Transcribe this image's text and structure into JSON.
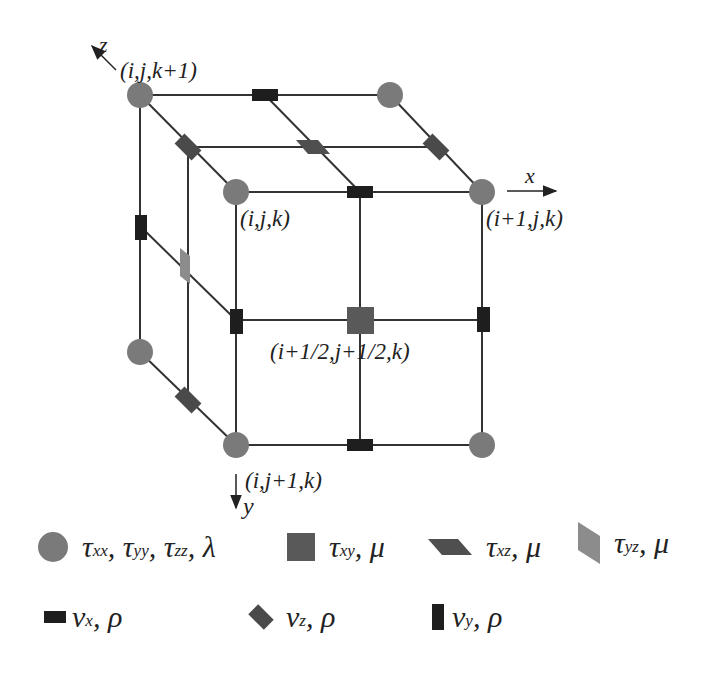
{
  "figure": {
    "type": "staggered-grid-cell",
    "axes": {
      "x": "x",
      "y": "y",
      "z": "z"
    },
    "node_labels": {
      "back_top_left": "(i,j,k+1)",
      "front_top_left": "(i,j,k)",
      "front_top_right": "(i+1,j,k)",
      "center": "(i+1/2,j+1/2,k)",
      "front_bottom_left": "(i,j+1,k)"
    },
    "colors": {
      "normal_stress": "#7a7a7a",
      "shear_xy": "#595959",
      "shear_xz": "#4f4f4f",
      "shear_yz": "#8c8c8c",
      "velocity_x": "#1e1e1e",
      "velocity_y": "#1e1e1e",
      "velocity_z": "#4a4a4a",
      "grid_line": "#333333"
    }
  },
  "legend": {
    "row1": [
      {
        "symbol": "circle",
        "name": "normal-stress",
        "parts": [
          "τ",
          "xx",
          ", τ",
          "yy",
          ", τ",
          "zz",
          ", λ"
        ]
      },
      {
        "symbol": "square",
        "name": "shear-xy",
        "parts": [
          "τ",
          "xy",
          ", μ"
        ]
      },
      {
        "symbol": "parallelogram-horizontal",
        "name": "shear-xz",
        "parts": [
          "τ",
          "xz",
          ", μ"
        ]
      },
      {
        "symbol": "parallelogram-vertical",
        "name": "shear-yz",
        "parts": [
          "τ",
          "yz",
          ", μ"
        ]
      }
    ],
    "row2": [
      {
        "symbol": "rect-horizontal",
        "name": "velocity-x",
        "parts": [
          "v",
          "x",
          ", ρ"
        ]
      },
      {
        "symbol": "diamond",
        "name": "velocity-z",
        "parts": [
          "v",
          "z",
          ", ρ"
        ]
      },
      {
        "symbol": "rect-vertical",
        "name": "velocity-y",
        "parts": [
          "v",
          "y",
          ", ρ"
        ]
      }
    ]
  }
}
